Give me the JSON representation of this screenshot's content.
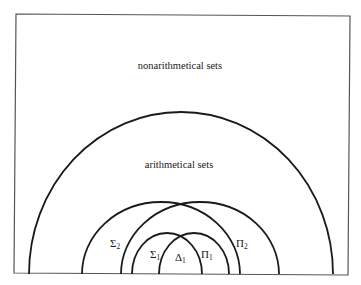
{
  "diagram": {
    "type": "nested-set-diagram",
    "colors": {
      "background": "#ffffff",
      "frame": "#555555",
      "curves": "#1a1a1a",
      "text": "#1a1a1a"
    },
    "regions": {
      "outer": {
        "label": "nonarithmetical sets"
      },
      "arithmetical": {
        "label": "arithmetical sets"
      }
    },
    "classes": [
      {
        "id": "sigma2",
        "symbol": "Σ",
        "subscript": "2"
      },
      {
        "id": "pi2",
        "symbol": "Π",
        "subscript": "2"
      },
      {
        "id": "sigma1",
        "symbol": "Σ",
        "subscript": "1"
      },
      {
        "id": "pi1",
        "symbol": "Π",
        "subscript": "1"
      },
      {
        "id": "delta1",
        "symbol": "Δ",
        "subscript": "1"
      }
    ]
  }
}
